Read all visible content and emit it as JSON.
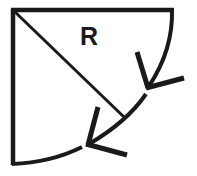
{
  "diagram": {
    "type": "quarter-circle sector with radius and arc arrows",
    "label": "R",
    "colors": {
      "stroke": "#1a1a1a",
      "background": "#ffffff"
    },
    "elements": [
      {
        "name": "left-edge",
        "kind": "line"
      },
      {
        "name": "top-edge",
        "kind": "line"
      },
      {
        "name": "arc",
        "kind": "curve"
      },
      {
        "name": "radius-line",
        "kind": "line",
        "label": "R"
      },
      {
        "name": "arrow-upper",
        "kind": "arrowhead",
        "direction": "down-left along arc"
      },
      {
        "name": "arrow-lower",
        "kind": "arrowhead",
        "direction": "down-left along arc"
      }
    ]
  }
}
